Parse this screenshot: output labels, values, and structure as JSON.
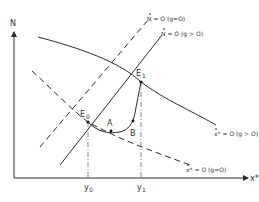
{
  "diagram": {
    "axes": {
      "y_label": "N",
      "x_label": "x*"
    },
    "curves": {
      "xstar_g_pos": {
        "label": "x* = O (g > O)",
        "style": "solid"
      },
      "xstar_g_zero": {
        "label": "x* = O (g=O)",
        "style": "dashed"
      },
      "ndot_g_zero": {
        "label": "N = O (g=O)",
        "style": "dashed"
      },
      "ndot_g_pos": {
        "label": "N = O (g > O)",
        "style": "solid"
      }
    },
    "points": {
      "E0": "E",
      "E0_sub": "0",
      "E1": "E",
      "E1_sub": "1",
      "A": "A",
      "B": "B"
    },
    "ticks": {
      "y0": "y",
      "y0_sub": "0",
      "y1": "y",
      "y1_sub": "1"
    },
    "colors": {
      "line": "#2a2a2a",
      "background": "#ffffff"
    }
  }
}
